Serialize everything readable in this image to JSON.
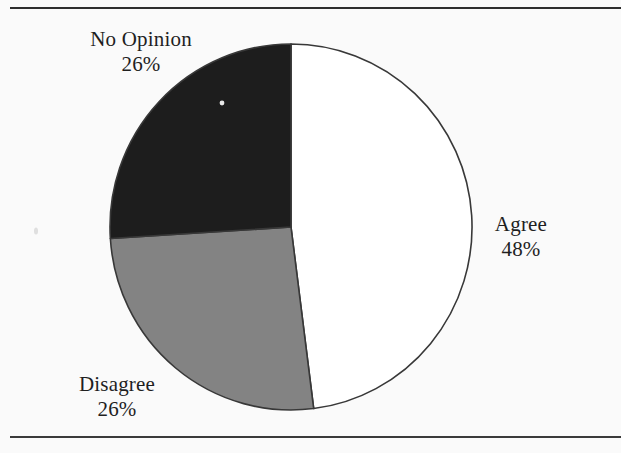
{
  "figure": {
    "ink_color": "#2e2e2e",
    "paper_color": "#fafafa"
  },
  "chart_data": {
    "type": "pie",
    "title": "",
    "start_angle_deg": 0,
    "direction": "clockwise",
    "legend": "none",
    "slices": [
      {
        "label": "Agree",
        "value": 48,
        "pct_label": "48%",
        "color": "#ffffff"
      },
      {
        "label": "Disagree",
        "value": 26,
        "pct_label": "26%",
        "color": "#838383"
      },
      {
        "label": "No Opinion",
        "value": 26,
        "pct_label": "26%",
        "color": "#1d1d1d"
      }
    ]
  }
}
